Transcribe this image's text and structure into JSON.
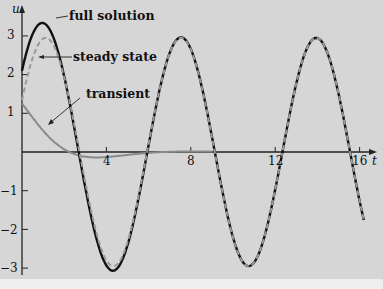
{
  "chart_data": {
    "type": "line",
    "title": "",
    "xlabel": "t",
    "ylabel": "u",
    "xlim": [
      0,
      16.5
    ],
    "ylim": [
      -3.2,
      3.6
    ],
    "x_ticks": [
      4,
      8,
      12,
      16
    ],
    "x_tick_labels": [
      "4",
      "8",
      "12",
      "16"
    ],
    "y_ticks": [
      -3,
      -2,
      -1,
      1,
      2,
      3
    ],
    "y_tick_labels": [
      "-3",
      "-2",
      "-1",
      "1",
      "2",
      "3"
    ],
    "grid": false,
    "legend": "inline annotations",
    "series": [
      {
        "name": "full solution",
        "style": "solid black thick",
        "x": [
          0,
          1,
          2,
          3,
          4,
          4.5,
          5,
          6,
          7,
          7.7,
          8,
          9,
          10,
          10.8,
          11,
          12,
          13,
          14,
          15,
          16
        ],
        "values": [
          2.1,
          3.5,
          2.8,
          0.2,
          -2.6,
          -3.05,
          -2.8,
          -0.6,
          2.0,
          2.9,
          2.8,
          1.0,
          -2.0,
          -2.95,
          -2.8,
          -0.6,
          1.9,
          2.9,
          1.4,
          -1.5
        ]
      },
      {
        "name": "steady state",
        "style": "dashed gray",
        "x": [
          0,
          1,
          1.2,
          2,
          3,
          4,
          4.5,
          5,
          6,
          7,
          7.7,
          8,
          9,
          10,
          10.8,
          11,
          12,
          13,
          14,
          15,
          16
        ],
        "values": [
          0.9,
          2.8,
          2.9,
          2.5,
          0.4,
          -2.5,
          -2.95,
          -2.8,
          -0.6,
          2.0,
          2.9,
          2.8,
          1.0,
          -2.0,
          -2.95,
          -2.8,
          -0.6,
          1.9,
          2.9,
          1.4,
          -1.5
        ]
      },
      {
        "name": "transient",
        "style": "solid gray",
        "x": [
          0,
          1,
          2,
          3,
          4,
          5,
          6,
          7,
          8
        ],
        "values": [
          1.25,
          1.0,
          0.45,
          -0.15,
          -0.25,
          -0.15,
          -0.03,
          0.0,
          0.0
        ]
      }
    ],
    "annotations": [
      "full solution",
      "steady state",
      "transient"
    ]
  },
  "labels": {
    "y_axis": "u",
    "x_axis": "t",
    "full": "full solution",
    "steady": "steady state",
    "transient": "transient",
    "xt4": "4",
    "xt8": "8",
    "xt12": "12",
    "xt16": "16",
    "yt3": "3",
    "yt2": "2",
    "yt1": "1",
    "ytm1": "−1",
    "ytm2": "−2",
    "ytm3": "−3"
  },
  "params": {
    "amp": 2.95,
    "omega": 0.98,
    "phase": -1.1,
    "c0": 1.25,
    "decay": 0.55,
    "w2": 0.7,
    "t_end": 16.2
  }
}
